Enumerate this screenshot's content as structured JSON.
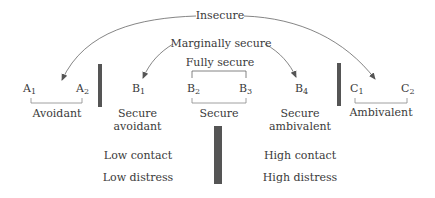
{
  "top_labels": {
    "insecure": "Insecure",
    "marginally_secure": "Marginally secure",
    "fully_secure": "Fully secure"
  },
  "subgroups": [
    {
      "letter": "A",
      "sub": "1"
    },
    {
      "letter": "A",
      "sub": "2"
    },
    {
      "letter": "B",
      "sub": "1"
    },
    {
      "letter": "B",
      "sub": "2"
    },
    {
      "letter": "B",
      "sub": "3"
    },
    {
      "letter": "B",
      "sub": "4"
    },
    {
      "letter": "C",
      "sub": "1"
    },
    {
      "letter": "C",
      "sub": "2"
    }
  ],
  "categories": {
    "avoidant": "Avoidant",
    "secure_avoidant_line1": "Secure",
    "secure_avoidant_line2": "avoidant",
    "secure": "Secure",
    "secure_ambivalent_line1": "Secure",
    "secure_ambivalent_line2": "ambivalent",
    "ambivalent": "Ambivalent"
  },
  "dimensions": {
    "low_contact": "Low contact",
    "low_distress": "Low distress",
    "high_contact": "High contact",
    "high_distress": "High distress"
  },
  "colors": {
    "text": "#3a3a3a",
    "bar": "#555555",
    "line": "#555555"
  }
}
